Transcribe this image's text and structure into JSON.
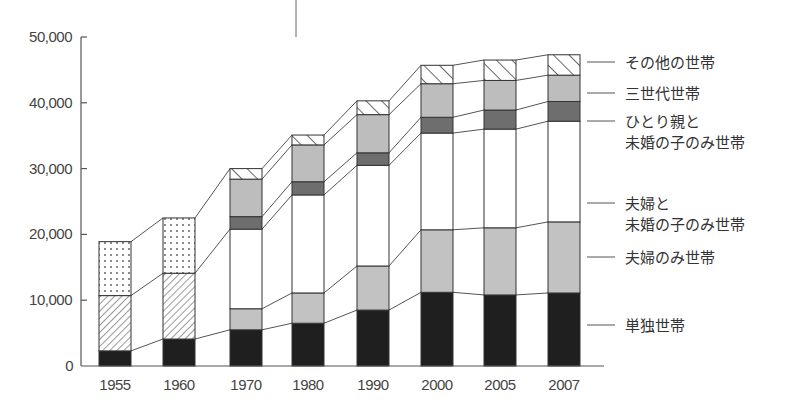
{
  "chart_data": {
    "type": "bar",
    "stacked": true,
    "title": "",
    "xlabel": "",
    "ylabel": "",
    "ylim": [
      0,
      50000
    ],
    "yticks": [
      0,
      10000,
      20000,
      30000,
      40000,
      50000
    ],
    "ytick_labels": [
      "0",
      "10,000",
      "20,000",
      "30,000",
      "40,000",
      "50,000"
    ],
    "grid": false,
    "legend_position": "right (leader lines from last bar)",
    "categories": [
      "1955",
      "1960",
      "1970",
      "1980",
      "1990",
      "2000",
      "2005",
      "2007"
    ],
    "series_pre1970": [
      {
        "name": "pre-1970 bottom (solid black)",
        "pattern": "black",
        "values": [
          2300,
          4100,
          null,
          null,
          null,
          null,
          null,
          null
        ]
      },
      {
        "name": "pre-1970 middle (diagonal hatch)",
        "pattern": "fine-hatch",
        "values": [
          8400,
          10000,
          null,
          null,
          null,
          null,
          null,
          null
        ]
      },
      {
        "name": "pre-1970 top (dotted)",
        "pattern": "dots",
        "values": [
          8200,
          8400,
          null,
          null,
          null,
          null,
          null,
          null
        ]
      }
    ],
    "series": [
      {
        "name": "単独世帯",
        "pattern": "black",
        "values": [
          null,
          null,
          5500,
          6500,
          8500,
          11200,
          10800,
          11100
        ]
      },
      {
        "name": "夫婦のみ世帯",
        "pattern": "light-gray",
        "values": [
          null,
          null,
          3200,
          4600,
          6700,
          9500,
          10200,
          10800
        ]
      },
      {
        "name": "夫婦と未婚の子のみ世帯",
        "pattern": "white",
        "values": [
          null,
          null,
          12100,
          14900,
          15300,
          14700,
          15000,
          15300
        ]
      },
      {
        "name": "ひとり親と未婚の子のみ世帯",
        "pattern": "dark-gray",
        "values": [
          null,
          null,
          1900,
          2000,
          1900,
          2400,
          2900,
          3000
        ]
      },
      {
        "name": "三世代世帯",
        "pattern": "medium-gray",
        "values": [
          null,
          null,
          5700,
          5600,
          5800,
          5100,
          4500,
          4000
        ]
      },
      {
        "name": "その他の世帯",
        "pattern": "wide-hatch",
        "values": [
          null,
          null,
          1600,
          1500,
          2100,
          2800,
          3100,
          3100
        ]
      }
    ],
    "totals": [
      18900,
      22500,
      30000,
      35100,
      40300,
      45700,
      46500,
      47300
    ]
  },
  "legend": {
    "items": [
      {
        "lines": [
          "その他の世帯"
        ],
        "y": 62
      },
      {
        "lines": [
          "三世代世帯"
        ],
        "y": 93
      },
      {
        "lines": [
          "ひとり親と",
          "未婚の子のみ世帯"
        ],
        "y": 121
      },
      {
        "lines": [
          "夫婦と",
          "未婚の子のみ世帯"
        ],
        "y": 203
      },
      {
        "lines": [
          "夫婦のみ世帯"
        ],
        "y": 257
      },
      {
        "lines": [
          "単独世帯"
        ],
        "y": 325
      }
    ]
  },
  "colors": {
    "black": "#1f1f1f",
    "light-gray": "#c2c2c2",
    "white": "#ffffff",
    "dark-gray": "#6e6e6e",
    "medium-gray": "#bdbdbd",
    "axis": "#555555"
  }
}
